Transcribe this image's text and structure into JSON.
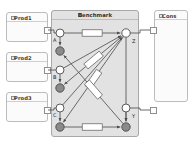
{
  "canvas": {
    "width": 190,
    "height": 152,
    "background": "#ffffff"
  },
  "colors": {
    "panel_fill": "#f7f7f7",
    "panel_border": "#b9b9b9",
    "benchmark_fill": "#e2e2e2",
    "benchmark_border": "#a8a8a8",
    "node_open_fill": "#ffffff",
    "node_filled_fill": "#8a8a8a",
    "node_stroke": "#4a4a4a",
    "edge_stroke": "#5a5a5a",
    "link_box_fill": "#ffffff",
    "port_fill": "#ffffff",
    "port_border": "#8e8e8e",
    "text": "#333333"
  },
  "producers": [
    {
      "title": "Prod1",
      "icon": "document-icon",
      "x": 6,
      "y": 12,
      "w": 42,
      "h": 30,
      "port": {
        "x": 44,
        "y": 30
      }
    },
    {
      "title": "Prod2",
      "icon": "document-icon",
      "x": 6,
      "y": 52,
      "w": 42,
      "h": 30,
      "port": {
        "x": 44,
        "y": 70
      }
    },
    {
      "title": "Prod3",
      "icon": "document-icon",
      "x": 6,
      "y": 92,
      "w": 42,
      "h": 30,
      "port": {
        "x": 44,
        "y": 110
      }
    }
  ],
  "benchmark": {
    "title": "Benchmark",
    "icon": "benchmark-icon",
    "x": 51,
    "y": 10,
    "w": 88,
    "h": 127
  },
  "consumer": {
    "title": "Cons",
    "icon": "document-icon",
    "x": 154,
    "y": 10,
    "w": 34,
    "h": 92,
    "ports": [
      {
        "x": 150,
        "y": 30
      },
      {
        "x": 150,
        "y": 110
      }
    ]
  },
  "nodes": [
    {
      "id": "A",
      "label": "A",
      "x": 60,
      "y": 33,
      "r": 4,
      "style": "open",
      "label_dx": -7,
      "label_dy": 5
    },
    {
      "id": "A2",
      "label": "",
      "x": 60,
      "y": 51,
      "r": 4.2,
      "style": "filled",
      "label_dx": 0,
      "label_dy": 0
    },
    {
      "id": "B",
      "label": "B",
      "x": 60,
      "y": 70,
      "r": 4,
      "style": "open",
      "label_dx": -7,
      "label_dy": 5
    },
    {
      "id": "B2",
      "label": "",
      "x": 60,
      "y": 88,
      "r": 4.2,
      "style": "filled",
      "label_dx": 0,
      "label_dy": 0
    },
    {
      "id": "C",
      "label": "C",
      "x": 60,
      "y": 108,
      "r": 4,
      "style": "open",
      "label_dx": -7,
      "label_dy": 5
    },
    {
      "id": "C2",
      "label": "",
      "x": 60,
      "y": 127,
      "r": 4.2,
      "style": "filled",
      "label_dx": 0,
      "label_dy": 0
    },
    {
      "id": "Z",
      "label": "Z",
      "x": 126,
      "y": 33,
      "r": 4.2,
      "style": "open",
      "label_dx": 6,
      "label_dy": 6
    },
    {
      "id": "Y",
      "label": "Y",
      "x": 126,
      "y": 108,
      "r": 4,
      "style": "open",
      "label_dx": 6,
      "label_dy": 6
    },
    {
      "id": "Y2",
      "label": "",
      "x": 126,
      "y": 127,
      "r": 4.2,
      "style": "filled",
      "label_dx": 0,
      "label_dy": 0
    }
  ],
  "edges": [
    {
      "from": "A",
      "to": "Z",
      "link_box": true,
      "arrow": true
    },
    {
      "from": "A",
      "to": "A2",
      "link_box": false,
      "arrow": true
    },
    {
      "from": "B",
      "to": "B2",
      "link_box": false,
      "arrow": true
    },
    {
      "from": "C",
      "to": "C2",
      "link_box": false,
      "arrow": true
    },
    {
      "from": "Y",
      "to": "Y2",
      "link_box": false,
      "arrow": true
    },
    {
      "from": "C2",
      "to": "Y2",
      "link_box": true,
      "arrow": true
    },
    {
      "from": "Z",
      "to": "B2",
      "link_box": true,
      "arrow": true
    },
    {
      "from": "Z",
      "to": "C2",
      "link_box": true,
      "arrow": true
    },
    {
      "from": "Y2",
      "to": "A2",
      "link_box": true,
      "arrow": true
    },
    {
      "from": "Z",
      "to": "Y2",
      "link_box": false,
      "arrow": true
    },
    {
      "from": "B",
      "to": "Z",
      "link_box": false,
      "arrow": true
    },
    {
      "from": "C",
      "to": "Z",
      "link_box": false,
      "arrow": true
    }
  ],
  "connectors": [
    {
      "name": "prod1-to-A",
      "from": {
        "x": 48,
        "y": 30
      },
      "to": {
        "x": 60,
        "y": 33
      }
    },
    {
      "name": "prod2-to-B",
      "from": {
        "x": 48,
        "y": 70
      },
      "to": {
        "x": 60,
        "y": 70
      }
    },
    {
      "name": "prod3-to-C",
      "from": {
        "x": 48,
        "y": 110
      },
      "to": {
        "x": 60,
        "y": 108
      }
    },
    {
      "name": "Z-to-cons",
      "from": {
        "x": 130,
        "y": 33
      },
      "to": {
        "x": 150,
        "y": 30
      }
    },
    {
      "name": "Y-to-cons",
      "from": {
        "x": 130,
        "y": 108
      },
      "to": {
        "x": 150,
        "y": 110
      }
    }
  ]
}
